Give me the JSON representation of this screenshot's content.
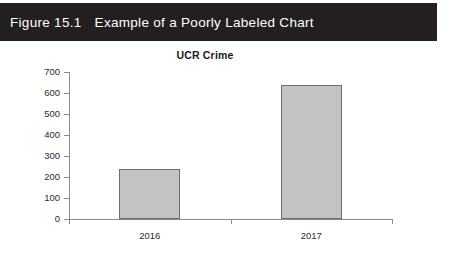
{
  "figure": {
    "number": "Figure 15.1",
    "title": "Example of a Poorly Labeled Chart",
    "banner_color": "#231f20",
    "banner_text_color": "#ffffff"
  },
  "chart_data": {
    "type": "bar",
    "title": "UCR Crime",
    "xlabel": "",
    "ylabel": "",
    "categories": [
      "2016",
      "2017"
    ],
    "values": [
      240,
      640
    ],
    "ylim": [
      0,
      700
    ],
    "ytick_labels": [
      "0",
      "100",
      "200",
      "300",
      "400",
      "500",
      "600",
      "700"
    ],
    "ytick_values": [
      0,
      100,
      200,
      300,
      400,
      500,
      600,
      700
    ],
    "grid": false,
    "legend": false,
    "legend_position": "none",
    "bar_fill_color": "#c3c3c3",
    "bar_border_color": "#6e6e6e",
    "axis_color": "#8a8a8a",
    "text_color": "#2a2a2a"
  }
}
